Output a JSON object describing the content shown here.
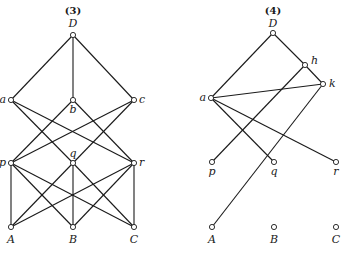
{
  "diagrams": [
    {
      "title": "(3)",
      "title_pos": [
        73,
        14
      ],
      "nodes": [
        {
          "id": "D",
          "label": "D",
          "x": 73,
          "y": 35,
          "lx": 73,
          "ly": 27,
          "anchor": "middle"
        },
        {
          "id": "a",
          "label": "a",
          "x": 11,
          "y": 100,
          "lx": 6,
          "ly": 103,
          "anchor": "end"
        },
        {
          "id": "b",
          "label": "b",
          "x": 73,
          "y": 100,
          "lx": 73,
          "ly": 113,
          "anchor": "middle"
        },
        {
          "id": "c",
          "label": "c",
          "x": 134,
          "y": 100,
          "lx": 139,
          "ly": 103,
          "anchor": "start"
        },
        {
          "id": "p",
          "label": "p",
          "x": 11,
          "y": 163,
          "lx": 6,
          "ly": 166,
          "anchor": "end"
        },
        {
          "id": "q",
          "label": "q",
          "x": 73,
          "y": 163,
          "lx": 73,
          "ly": 157,
          "anchor": "middle"
        },
        {
          "id": "r",
          "label": "r",
          "x": 134,
          "y": 163,
          "lx": 139,
          "ly": 166,
          "anchor": "start"
        },
        {
          "id": "A",
          "label": "A",
          "x": 11,
          "y": 227,
          "lx": 11,
          "ly": 243,
          "anchor": "middle"
        },
        {
          "id": "B",
          "label": "B",
          "x": 73,
          "y": 227,
          "lx": 73,
          "ly": 243,
          "anchor": "middle"
        },
        {
          "id": "C",
          "label": "C",
          "x": 134,
          "y": 227,
          "lx": 134,
          "ly": 243,
          "anchor": "middle"
        }
      ],
      "edges": [
        [
          "D",
          "a"
        ],
        [
          "D",
          "b"
        ],
        [
          "D",
          "c"
        ],
        [
          "a",
          "q"
        ],
        [
          "a",
          "r"
        ],
        [
          "b",
          "p"
        ],
        [
          "b",
          "r"
        ],
        [
          "c",
          "p"
        ],
        [
          "c",
          "q"
        ],
        [
          "p",
          "A"
        ],
        [
          "p",
          "B"
        ],
        [
          "p",
          "C"
        ],
        [
          "q",
          "A"
        ],
        [
          "q",
          "B"
        ],
        [
          "q",
          "C"
        ],
        [
          "r",
          "A"
        ],
        [
          "r",
          "B"
        ],
        [
          "r",
          "C"
        ]
      ]
    },
    {
      "title": "(4)",
      "title_pos": [
        273,
        14
      ],
      "nodes": [
        {
          "id": "D",
          "label": "D",
          "x": 273,
          "y": 33,
          "lx": 273,
          "ly": 27,
          "anchor": "middle"
        },
        {
          "id": "h",
          "label": "h",
          "x": 305,
          "y": 65,
          "lx": 311,
          "ly": 64,
          "anchor": "start"
        },
        {
          "id": "k",
          "label": "k",
          "x": 323,
          "y": 84,
          "lx": 329,
          "ly": 87,
          "anchor": "start"
        },
        {
          "id": "a",
          "label": "a",
          "x": 211,
          "y": 98,
          "lx": 206,
          "ly": 101,
          "anchor": "end"
        },
        {
          "id": "p",
          "label": "p",
          "x": 212,
          "y": 162,
          "lx": 212,
          "ly": 175,
          "anchor": "middle"
        },
        {
          "id": "q",
          "label": "q",
          "x": 274,
          "y": 162,
          "lx": 274,
          "ly": 175,
          "anchor": "middle"
        },
        {
          "id": "r",
          "label": "r",
          "x": 336,
          "y": 162,
          "lx": 336,
          "ly": 175,
          "anchor": "middle"
        },
        {
          "id": "A",
          "label": "A",
          "x": 212,
          "y": 227,
          "lx": 212,
          "ly": 243,
          "anchor": "middle"
        },
        {
          "id": "B",
          "label": "B",
          "x": 274,
          "y": 227,
          "lx": 274,
          "ly": 243,
          "anchor": "middle"
        },
        {
          "id": "C",
          "label": "C",
          "x": 336,
          "y": 227,
          "lx": 336,
          "ly": 243,
          "anchor": "middle"
        }
      ],
      "edges": [
        [
          "D",
          "a"
        ],
        [
          "D",
          "h"
        ],
        [
          "h",
          "k"
        ],
        [
          "a",
          "k"
        ],
        [
          "a",
          "q"
        ],
        [
          "a",
          "r"
        ],
        [
          "h",
          "p"
        ],
        [
          "k",
          "A"
        ]
      ]
    }
  ]
}
